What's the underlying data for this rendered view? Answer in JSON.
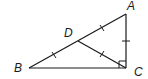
{
  "diagram": {
    "type": "geometry",
    "points": {
      "A": {
        "label": "A",
        "x": 126,
        "y": 14
      },
      "B": {
        "label": "B",
        "x": 29,
        "y": 68
      },
      "C": {
        "label": "C",
        "x": 126,
        "y": 68
      },
      "D": {
        "label": "D",
        "x": 78,
        "y": 41
      }
    },
    "segments": [
      "AB",
      "BC",
      "CA",
      "DC"
    ],
    "tick_marks": [
      "DA",
      "DB",
      "DC",
      "AC"
    ],
    "right_angle_at": "C",
    "stroke_color": "#1a1a1a"
  }
}
